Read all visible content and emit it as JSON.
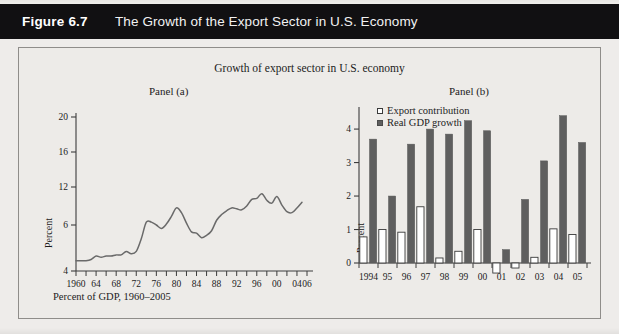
{
  "header": {
    "figure_number": "Figure 6.7",
    "title": "The Growth of the Export Sector in U.S. Economy"
  },
  "chart_title": "Growth of export sector in U.S. economy",
  "panel_a_label": "Panel (a)",
  "panel_b_label": "Panel (b)",
  "caption": "Percent of GDP, 1960–2005",
  "legend": {
    "export_contribution": "Export contribution",
    "real_gdp_growth": "Real GDP growth"
  },
  "colors": {
    "header_bg": "#111012",
    "header_text": "#ffffff",
    "paper": "#edebe8",
    "frame": "#8f8d8a",
    "line": "#6a6a6a",
    "bar_gdp": "#5f5f5f",
    "bar_export": "#ffffff",
    "bar_export_edge": "#3a3a3a",
    "axis": "#3c3c3c"
  },
  "chart_data": [
    {
      "type": "line",
      "panel": "Panel (a)",
      "title": "Growth of export sector in U.S. economy",
      "xlabel": "",
      "ylabel": "Percent",
      "xlim": [
        1960,
        2006
      ],
      "ylim": [
        4,
        21
      ],
      "grid": false,
      "legend_position": "none",
      "ytick_labels": [
        "20",
        "16",
        "12",
        "6",
        "4"
      ],
      "ytick_values": [
        20,
        16,
        12,
        8,
        4
      ],
      "xtick_labels": [
        "1960",
        "64",
        "68",
        "72",
        "76",
        "80",
        "84",
        "88",
        "92",
        "96",
        "00",
        "04",
        "06"
      ],
      "xtick_values": [
        1960,
        1964,
        1968,
        1972,
        1976,
        1980,
        1984,
        1988,
        1992,
        1996,
        2000,
        2004,
        2006
      ],
      "x": [
        1960,
        1961,
        1962,
        1963,
        1964,
        1965,
        1966,
        1967,
        1968,
        1969,
        1970,
        1971,
        1972,
        1973,
        1974,
        1975,
        1976,
        1977,
        1978,
        1979,
        1980,
        1981,
        1982,
        1983,
        1984,
        1985,
        1986,
        1987,
        1988,
        1989,
        1990,
        1991,
        1992,
        1993,
        1994,
        1995,
        1996,
        1997,
        1998,
        1999,
        2000,
        2001,
        2002,
        2003,
        2004,
        2005
      ],
      "values": [
        4.9,
        4.9,
        4.9,
        5.0,
        5.3,
        5.2,
        5.3,
        5.3,
        5.4,
        5.4,
        5.7,
        5.5,
        5.7,
        6.8,
        8.3,
        8.3,
        8.0,
        7.7,
        8.1,
        8.9,
        9.8,
        9.3,
        8.2,
        7.4,
        7.3,
        6.9,
        7.1,
        7.5,
        8.5,
        9.1,
        9.5,
        9.8,
        9.7,
        9.6,
        10.0,
        10.7,
        10.8,
        11.3,
        10.6,
        10.3,
        11.0,
        10.1,
        9.4,
        9.3,
        9.8,
        10.4
      ]
    },
    {
      "type": "bar",
      "panel": "Panel (b)",
      "xlabel": "",
      "ylabel": "Percent",
      "ylim": [
        -0.5,
        4.6
      ],
      "grid": false,
      "legend_position": "top-left",
      "ytick_labels": [
        "0",
        "1",
        "2",
        "3",
        "4"
      ],
      "ytick_values": [
        0,
        1,
        2,
        3,
        4
      ],
      "categories": [
        "1994",
        "95",
        "96",
        "97",
        "98",
        "99",
        "00",
        "01",
        "02",
        "03",
        "04",
        "05"
      ],
      "series": [
        {
          "name": "Export contribution",
          "values": [
            0.78,
            1.0,
            0.92,
            1.68,
            0.15,
            0.35,
            1.0,
            -0.3,
            -0.15,
            0.17,
            1.02,
            0.85
          ]
        },
        {
          "name": "Real GDP growth",
          "values": [
            3.7,
            2.0,
            3.55,
            4.0,
            3.85,
            4.25,
            3.95,
            0.4,
            1.9,
            3.05,
            4.4,
            3.6
          ]
        }
      ]
    }
  ]
}
